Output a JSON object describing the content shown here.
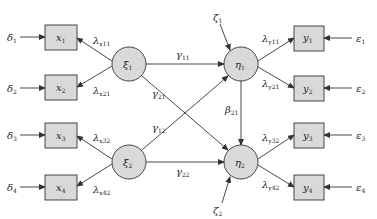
{
  "diagram": {
    "type": "structural-equation-model path diagram",
    "exogenous_latents": [
      {
        "id": "xi1",
        "label": "ξ",
        "sub": "1"
      },
      {
        "id": "xi2",
        "label": "ξ",
        "sub": "2"
      }
    ],
    "endogenous_latents": [
      {
        "id": "eta1",
        "label": "η",
        "sub": "1"
      },
      {
        "id": "eta2",
        "label": "η",
        "sub": "2"
      }
    ],
    "x_indicators": [
      {
        "id": "x1",
        "label": "x",
        "sub": "1",
        "error": "δ",
        "error_sub": "1",
        "loading": "λ",
        "loading_sub": "x11"
      },
      {
        "id": "x2",
        "label": "x",
        "sub": "2",
        "error": "δ",
        "error_sub": "2",
        "loading": "λ",
        "loading_sub": "x21"
      },
      {
        "id": "x3",
        "label": "x",
        "sub": "3",
        "error": "δ",
        "error_sub": "3",
        "loading": "λ",
        "loading_sub": "x32"
      },
      {
        "id": "x4",
        "label": "x",
        "sub": "4",
        "error": "δ",
        "error_sub": "4",
        "loading": "λ",
        "loading_sub": "x42"
      }
    ],
    "y_indicators": [
      {
        "id": "y1",
        "label": "y",
        "sub": "1",
        "error": "ε",
        "error_sub": "1",
        "loading": "λ",
        "loading_sub": "y11"
      },
      {
        "id": "y2",
        "label": "y",
        "sub": "2",
        "error": "ε",
        "error_sub": "2",
        "loading": "λ",
        "loading_sub": "y21"
      },
      {
        "id": "y3",
        "label": "y",
        "sub": "3",
        "error": "ε",
        "error_sub": "3",
        "loading": "λ",
        "loading_sub": "y32"
      },
      {
        "id": "y4",
        "label": "y",
        "sub": "4",
        "error": "ε",
        "error_sub": "4",
        "loading": "λ",
        "loading_sub": "y42"
      }
    ],
    "structural_paths": [
      {
        "label": "γ",
        "sub": "11"
      },
      {
        "label": "γ",
        "sub": "21"
      },
      {
        "label": "γ",
        "sub": "12"
      },
      {
        "label": "γ",
        "sub": "22"
      },
      {
        "label": "β",
        "sub": "21"
      }
    ],
    "disturbances": [
      {
        "label": "ζ",
        "sub": "1"
      },
      {
        "label": "ζ",
        "sub": "2"
      }
    ],
    "colors": {
      "node_fill": "#d9d9d9",
      "stroke": "#333333",
      "text": "#222222"
    }
  }
}
